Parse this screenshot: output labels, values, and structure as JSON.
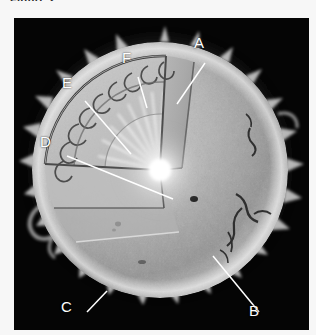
{
  "page": {
    "background_color": "#f7f7f7",
    "cut_off_caption": "Figure 2."
  },
  "figure": {
    "panel": {
      "x": 14,
      "y": 18,
      "width": 295,
      "height": 312,
      "background_color": "#050505",
      "name": "sun-cutaway-photograph"
    },
    "colors": {
      "panel_black": "#050505",
      "corona_white": "#ffffff",
      "photosphere_gray": "#a9a9a9",
      "interior_gray": "#c3c3c3",
      "core_white": "#ffffff",
      "leader_line": "#ffffff",
      "label_text": "#ffffff"
    },
    "labels": [
      {
        "id": "A",
        "text": "A",
        "x": 194,
        "y": 31,
        "leader": {
          "x1": 191,
          "y1": 45,
          "x2": 163,
          "y2": 86
        }
      },
      {
        "id": "B",
        "text": "B",
        "x": 249,
        "y": 299,
        "leader": {
          "x1": 245,
          "y1": 294,
          "x2": 199,
          "y2": 238
        }
      },
      {
        "id": "C",
        "text": "C",
        "x": 61,
        "y": 295,
        "leader": {
          "x1": 73,
          "y1": 294,
          "x2": 93,
          "y2": 273
        }
      },
      {
        "id": "D",
        "text": "D",
        "x": 40,
        "y": 130,
        "leader": {
          "x1": 53,
          "y1": 138,
          "x2": 159,
          "y2": 181
        }
      },
      {
        "id": "E",
        "text": "E",
        "x": 62,
        "y": 71,
        "leader": {
          "x1": 71,
          "y1": 83,
          "x2": 117,
          "y2": 136
        }
      },
      {
        "id": "F",
        "text": "F",
        "x": 122,
        "y": 46,
        "leader": {
          "x1": 124,
          "y1": 59,
          "x2": 133,
          "y2": 90
        }
      }
    ],
    "features": {
      "corona": "ragged white glow around the limb",
      "photosphere": "mottled gray solar surface with dark sunspots at right",
      "cutaway_wedge": "quadrant removed revealing interior shells",
      "core": "bright white point at wedge vertex with radiating rays",
      "granulation": "curled convective cell texture along the cut edge"
    }
  }
}
